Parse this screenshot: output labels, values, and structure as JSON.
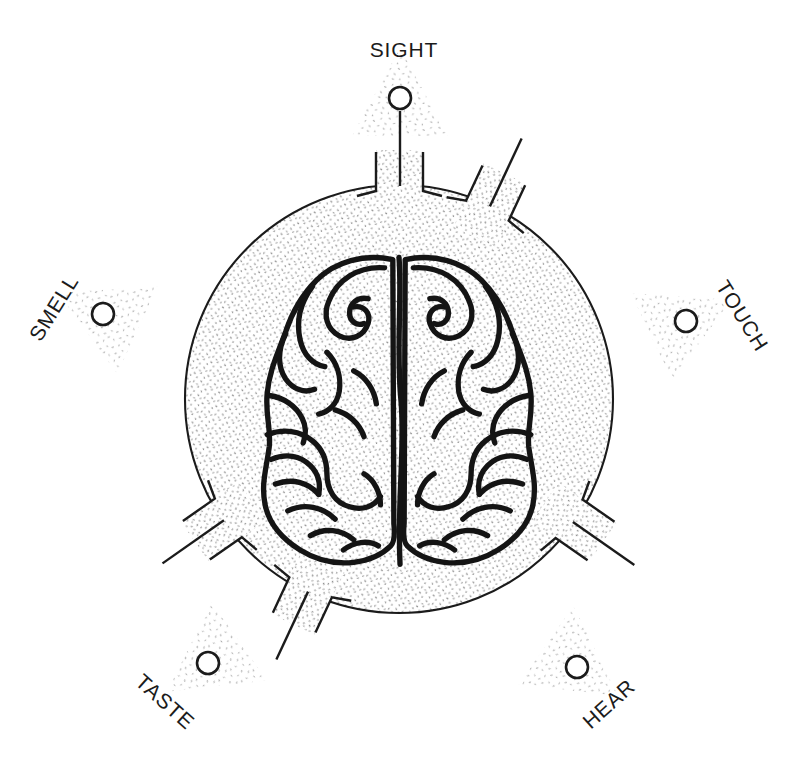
{
  "diagram": {
    "type": "concept-diagram",
    "background_color": "#ffffff",
    "ink_color": "#1b1b1b",
    "stipple_color": "#9a9a9a",
    "head_circle": {
      "cx": 399,
      "cy": 399,
      "r": 214
    },
    "brain": {
      "cx": 399,
      "cy": 410,
      "width": 260,
      "height": 300
    }
  },
  "senses": [
    {
      "id": "sight",
      "label": "SIGHT",
      "angle_deg": -90,
      "label_rotation_deg": 0,
      "label_x": 404,
      "label_y": 50,
      "node_x": 400,
      "node_y": 98,
      "node_r": 11
    },
    {
      "id": "smell",
      "label": "SMELL",
      "angle_deg": -155,
      "label_rotation_deg": -58,
      "label_x": 54,
      "label_y": 308,
      "node_x": 103,
      "node_y": 314,
      "node_r": 11
    },
    {
      "id": "touch",
      "label": "TOUCH",
      "angle_deg": -25,
      "label_rotation_deg": 58,
      "label_x": 742,
      "label_y": 316,
      "node_x": 686,
      "node_y": 321,
      "node_r": 11
    },
    {
      "id": "taste",
      "label": "TASTE",
      "angle_deg": 125,
      "label_rotation_deg": 42,
      "label_x": 165,
      "label_y": 702,
      "node_x": 208,
      "node_y": 663,
      "node_r": 11
    },
    {
      "id": "hear",
      "label": "HEAR",
      "angle_deg": 55,
      "label_rotation_deg": -42,
      "label_x": 609,
      "label_y": 704,
      "node_x": 577,
      "node_y": 667,
      "node_r": 11
    }
  ]
}
